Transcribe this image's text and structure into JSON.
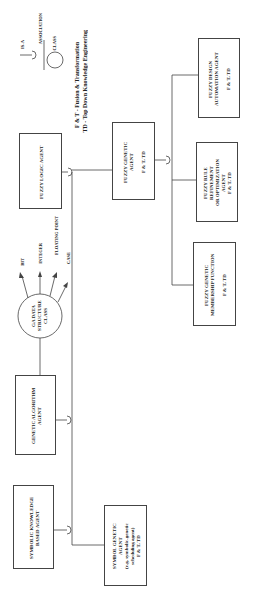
{
  "diagram": {
    "orientation": "rotated-90-ccw",
    "legend": {
      "is_a_label": "IS-A",
      "association_label": "ASSOCIATION",
      "class_label": "CLASS",
      "abbrev_1": "F & T - Fusion & Transformation",
      "abbrev_2": "TD - Top Down Knowledge Engineering"
    },
    "nodes": {
      "fuzzy_logic_agent": {
        "label": "FUZZY LOGIC  AGENT"
      },
      "fuzzy_genetic_agent": {
        "label": "FUZZY GENETIC\nAGENT\n\nF & T, TD"
      },
      "fuzzy_design_automation_agent": {
        "label": "FUZZY DESIGN\nAUTOMATION AGENT\n\nF & T, TD"
      },
      "fuzzy_rule_refinement_agent": {
        "label": "FUZZY RULE\nREFINEMENT\nOR OPTIMIZATION\nAGENT\nF & T, TD"
      },
      "fuzzy_genetic_membership_function": {
        "label": "FUZZY GENETIC\nMEMBERSHIP FUNCTION\n\nF & T, TD"
      },
      "ga_data_structure_class": {
        "label": "GA DATA\nSTRUCTURE\nCLASS"
      },
      "genetic_algorithm_agent": {
        "label": "GENETIC  ALGORITHM\nAGENT"
      },
      "symbolic_knowledge_based_agent": {
        "label": "SYMBOLIC KNOWLEDGE\nBASED AGENT"
      },
      "symbol_genetic_agent": {
        "label": "SYMBOL GENETIC\nAGENT\n(e.g. symbolic-genetic\nscheduling agent)\nF & T, TD"
      }
    },
    "ga_types": [
      "BIT",
      "INTEGER",
      "FLOATING POINT",
      "CASE"
    ]
  }
}
